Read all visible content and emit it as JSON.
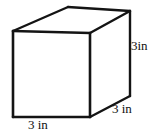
{
  "figure": {
    "name": "cube-diagram",
    "shape": "cube",
    "projection": "oblique",
    "background_color": "#ffffff",
    "line_color": "#141414",
    "face_color": "#ffffff",
    "labels": {
      "height": "3in",
      "depth": "3 in",
      "width": "3 in"
    },
    "geometry": {
      "front_top_left": [
        13,
        31
      ],
      "front_top_right": [
        90,
        33
      ],
      "front_bottom_right": [
        90,
        117
      ],
      "front_bottom_left": [
        13,
        117
      ],
      "back_top_left": [
        68,
        7
      ],
      "back_top_right": [
        130,
        11
      ],
      "back_bottom_right": [
        130,
        96
      ]
    }
  }
}
